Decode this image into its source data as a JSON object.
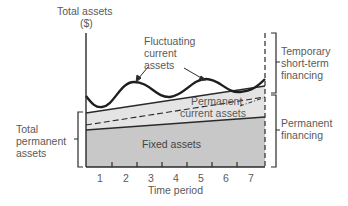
{
  "diagram": {
    "y_axis_label_line1": "Total assets",
    "y_axis_label_line2": "($)",
    "x_axis_label": "Time period",
    "x_ticks": [
      "1",
      "2",
      "3",
      "4",
      "5",
      "6",
      "7"
    ],
    "regions": {
      "fluctuating_line1": "Fluctuating",
      "fluctuating_line2": "current",
      "fluctuating_line3": "assets",
      "permanent_current_line1": "Permanent",
      "permanent_current_line2": "current assets",
      "fixed": "Fixed assets"
    },
    "left_brace": {
      "line1": "Total",
      "line2": "permanent",
      "line3": "assets"
    },
    "right_braces": {
      "temporary_line1": "Temporary",
      "temporary_line2": "short-term",
      "temporary_line3": "financing",
      "permanent_line1": "Permanent",
      "permanent_line2": "financing"
    },
    "colors": {
      "fixed_fill": "#c8c8c8",
      "permanent_current_fill": "#e4e4e4",
      "line": "#2a2a2a",
      "text": "#5a5a5a"
    }
  }
}
